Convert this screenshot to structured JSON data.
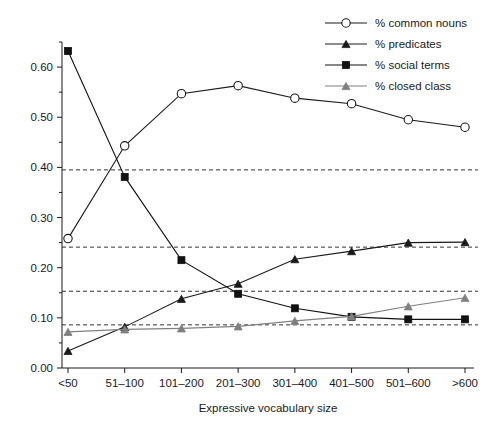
{
  "chart_data": {
    "type": "line",
    "title": "",
    "xlabel": "Expressive vocabulary size",
    "ylabel": "",
    "categories": [
      "<50",
      "51–100",
      "101–200",
      "201–300",
      "301–400",
      "401–500",
      "501–600",
      ">600"
    ],
    "ylim": [
      0.0,
      0.65
    ],
    "ytick_labels": [
      "0.00",
      "0.05",
      "0.10",
      "0.15",
      "0.20",
      "0.25",
      "0.30",
      "0.35",
      "0.40",
      "0.45",
      "0.50",
      "0.55",
      "0.60",
      "0.65"
    ],
    "ytick_values": [
      0.0,
      0.05,
      0.1,
      0.15,
      0.2,
      0.25,
      0.3,
      0.35,
      0.4,
      0.45,
      0.5,
      0.55,
      0.6,
      0.65
    ],
    "grid": false,
    "legend_position": "top-right",
    "reference_lines": [
      0.395,
      0.241,
      0.153,
      0.086
    ],
    "series": [
      {
        "name": "% common nouns",
        "marker": "open-circle",
        "color": "#1a1a1a",
        "values": [
          0.258,
          0.443,
          0.547,
          0.563,
          0.538,
          0.527,
          0.495,
          0.48
        ]
      },
      {
        "name": "% predicates",
        "marker": "filled-triangle",
        "color": "#1a1a1a",
        "values": [
          0.034,
          0.082,
          0.138,
          0.168,
          0.217,
          0.233,
          0.25,
          0.251
        ]
      },
      {
        "name": "% social terms",
        "marker": "filled-square",
        "color": "#111111",
        "values": [
          0.632,
          0.381,
          0.215,
          0.148,
          0.119,
          0.102,
          0.097,
          0.097
        ]
      },
      {
        "name": "% closed class",
        "marker": "gray-triangle",
        "color": "#808080",
        "values": [
          0.072,
          0.077,
          0.079,
          0.083,
          0.094,
          0.103,
          0.123,
          0.14
        ]
      }
    ]
  },
  "legend": {
    "items": [
      {
        "label": "% common nouns",
        "marker": "open-circle",
        "color": "#1a1a1a"
      },
      {
        "label": "% predicates",
        "marker": "filled-triangle",
        "color": "#1a1a1a"
      },
      {
        "label": "% social terms",
        "marker": "filled-square",
        "color": "#111111"
      },
      {
        "label": "% closed class",
        "marker": "gray-triangle",
        "color": "#808080"
      }
    ]
  }
}
